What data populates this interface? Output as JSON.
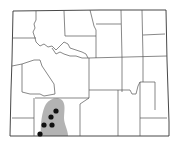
{
  "map": {
    "region": "Wyoming",
    "background": "#ffffff",
    "border_color": "#444444",
    "range_fill": "#b3b3b3",
    "point_color": "#111111",
    "range_label": "distribution-range",
    "points": [
      {
        "x": 56,
        "y": 111
      },
      {
        "x": 51,
        "y": 117
      },
      {
        "x": 44,
        "y": 125
      },
      {
        "x": 52,
        "y": 125
      },
      {
        "x": 40,
        "y": 134
      }
    ]
  }
}
